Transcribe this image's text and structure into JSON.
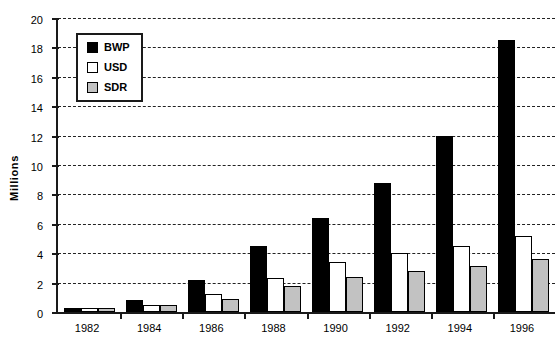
{
  "chart_data": {
    "type": "bar",
    "title": "",
    "xlabel": "",
    "ylabel": "Millions",
    "ylim": [
      0,
      20
    ],
    "yticks": [
      0,
      2,
      4,
      6,
      8,
      10,
      12,
      14,
      16,
      18,
      20
    ],
    "grid": true,
    "legend_position": "top-left",
    "categories": [
      "1982",
      "1984",
      "1986",
      "1988",
      "1990",
      "1992",
      "1994",
      "1996"
    ],
    "series": [
      {
        "name": "BWP",
        "color": "#000000",
        "values": [
          0.3,
          0.8,
          2.2,
          4.5,
          6.4,
          8.8,
          12.0,
          18.5
        ]
      },
      {
        "name": "USD",
        "color": "#ffffff",
        "values": [
          0.3,
          0.45,
          1.2,
          2.3,
          3.4,
          4.0,
          4.5,
          5.2
        ]
      },
      {
        "name": "SDR",
        "color": "#c2c2c2",
        "values": [
          0.25,
          0.45,
          0.9,
          1.8,
          2.4,
          2.8,
          3.1,
          3.6
        ]
      }
    ]
  },
  "axis": {
    "y_title": "Millions"
  }
}
